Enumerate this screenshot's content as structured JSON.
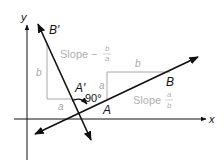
{
  "diagram": {
    "axes": {
      "x_label": "x",
      "y_label": "y"
    },
    "points": {
      "B_prime": "B′",
      "A_prime": "A′",
      "A": "A",
      "B": "B"
    },
    "left_triangle": {
      "vertical_label": "b",
      "horizontal_label": "a"
    },
    "right_triangle": {
      "vertical_label": "a",
      "horizontal_label": "b"
    },
    "angle_label": "90°",
    "slope_left": {
      "text": "Slope",
      "sign": "−",
      "numerator": "b",
      "denominator": "a"
    },
    "slope_right": {
      "text": "Slope",
      "numerator": "a",
      "denominator": "b"
    },
    "colors": {
      "line": "#111111",
      "guide": "#a8a8a8",
      "text_gray": "#b0b0b0"
    }
  }
}
